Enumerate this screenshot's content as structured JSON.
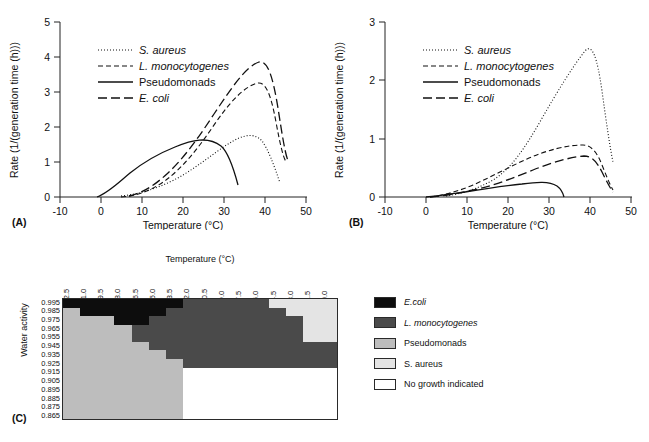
{
  "figure": {
    "panel_a_letter": "(A)",
    "panel_b_letter": "(B)",
    "panel_c_letter": "(C)"
  },
  "panelA": {
    "ylabel": "Rate (1/(generation time (h)))",
    "xlabel": "Temperature (°C)",
    "xticks": [
      "-10",
      "0",
      "10",
      "20",
      "30",
      "40",
      "50"
    ],
    "yticks": [
      "0",
      "1",
      "2",
      "3",
      "4",
      "5"
    ],
    "legend": [
      {
        "label": "S. aureus",
        "style": "dotted",
        "italic": true
      },
      {
        "label": "L. monocytogenes",
        "style": "dashed",
        "italic": true
      },
      {
        "label": "Pseudomonads",
        "style": "solid",
        "italic": false
      },
      {
        "label": "E. coli",
        "style": "longdash",
        "italic": true
      }
    ]
  },
  "panelB": {
    "ylabel": "Rate (1/(generation time (h)))",
    "xlabel": "Temperature (°C)",
    "xticks": [
      "-10",
      "0",
      "10",
      "20",
      "30",
      "40",
      "50"
    ],
    "yticks": [
      "0",
      "1",
      "2",
      "3"
    ],
    "legend": [
      {
        "label": "S. aureus",
        "style": "dotted",
        "italic": true
      },
      {
        "label": "L. monocytogenes",
        "style": "dashed",
        "italic": true
      },
      {
        "label": "Pseudomonads",
        "style": "solid",
        "italic": false
      },
      {
        "label": "E. coli",
        "style": "longdash",
        "italic": true
      }
    ]
  },
  "panelC": {
    "xlabel": "Temperature (°C)",
    "ylabel": "Water activity",
    "columns": [
      "22.5",
      "21.0",
      "19.5",
      "18.0",
      "16.5",
      "15.0",
      "13.5",
      "12.0",
      "10.5",
      "9.0",
      "7.5",
      "6.0",
      "4.5",
      "3.0",
      "1.5",
      "0.0"
    ],
    "rows": [
      "0.995",
      "0.985",
      "0.975",
      "0.965",
      "0.955",
      "0.945",
      "0.935",
      "0.925",
      "0.915",
      "0.905",
      "0.895",
      "0.885",
      "0.875",
      "0.865"
    ],
    "legend": [
      {
        "label": "E.coli",
        "color": "#0d0d0d",
        "italic": true
      },
      {
        "label": "L. monocytogenes",
        "color": "#4a4a4a",
        "italic": true
      },
      {
        "label": "Pseudomonads",
        "color": "#bdbdbd",
        "italic": false
      },
      {
        "label": "S. aureus",
        "color": "#e4e4e4",
        "italic": false
      },
      {
        "label": "No growth indicated",
        "color": "#ffffff",
        "italic": false
      }
    ],
    "colors": {
      "ecoli": "#0d0d0d",
      "listeria": "#4a4a4a",
      "pseudomonads": "#bdbdbd",
      "saureus": "#e4e4e4",
      "nogrowth": "#ffffff"
    }
  },
  "chart_data": [
    {
      "type": "line",
      "panel": "A",
      "title": "",
      "xlabel": "Temperature (°C)",
      "ylabel": "Rate (1/(generation time (h)))",
      "xlim": [
        -10,
        50
      ],
      "ylim": [
        0,
        5
      ],
      "xticks": [
        -10,
        0,
        10,
        20,
        30,
        40,
        50
      ],
      "yticks": [
        0,
        1,
        2,
        3,
        4,
        5
      ],
      "grid": false,
      "legend_position": "upper-left-inside",
      "series": [
        {
          "name": "S. aureus",
          "style": "dotted",
          "x": [
            5,
            10,
            15,
            20,
            25,
            30,
            35,
            40,
            42,
            44,
            45,
            46,
            46.5
          ],
          "y": [
            0.05,
            0.15,
            0.32,
            0.55,
            0.85,
            1.15,
            1.42,
            1.58,
            1.55,
            1.35,
            1.05,
            0.6,
            0.35
          ]
        },
        {
          "name": "L. monocytogenes",
          "style": "dashed",
          "x": [
            5,
            10,
            15,
            20,
            25,
            30,
            35,
            40,
            42,
            43,
            44,
            45,
            46,
            47
          ],
          "y": [
            0.02,
            0.12,
            0.38,
            0.8,
            1.45,
            2.2,
            2.9,
            3.22,
            3.25,
            3.1,
            2.7,
            2.0,
            1.3,
            1.0
          ]
        },
        {
          "name": "Pseudomonads",
          "style": "solid",
          "x": [
            -1,
            5,
            10,
            15,
            20,
            25,
            28,
            31,
            33,
            34.5,
            36
          ],
          "y": [
            0.0,
            0.3,
            0.62,
            0.92,
            1.12,
            1.32,
            1.42,
            1.45,
            1.35,
            1.0,
            0.4
          ]
        },
        {
          "name": "E. coli",
          "style": "longdash",
          "x": [
            7,
            10,
            15,
            20,
            25,
            30,
            35,
            40,
            42,
            43,
            44,
            45,
            46,
            47
          ],
          "y": [
            0.05,
            0.18,
            0.52,
            1.05,
            1.8,
            2.7,
            3.65,
            4.12,
            4.2,
            4.05,
            3.55,
            2.7,
            1.7,
            1.0
          ]
        }
      ]
    },
    {
      "type": "line",
      "panel": "B",
      "title": "",
      "xlabel": "Temperature (°C)",
      "ylabel": "Rate (1/(generation time (h)))",
      "xlim": [
        -10,
        50
      ],
      "ylim": [
        0,
        3
      ],
      "xticks": [
        -10,
        0,
        10,
        20,
        30,
        40,
        50
      ],
      "yticks": [
        0,
        1,
        2,
        3
      ],
      "grid": false,
      "legend_position": "upper-left-inside",
      "series": [
        {
          "name": "S. aureus",
          "style": "dotted",
          "x": [
            5,
            10,
            15,
            20,
            25,
            30,
            35,
            40,
            41,
            42,
            43,
            44,
            45,
            46,
            46.5
          ],
          "y": [
            0.02,
            0.08,
            0.22,
            0.5,
            1.0,
            1.6,
            2.15,
            2.48,
            2.5,
            2.42,
            2.2,
            1.8,
            1.15,
            0.7,
            0.6
          ]
        },
        {
          "name": "L. monocytogenes",
          "style": "dashed",
          "x": [
            2,
            5,
            10,
            15,
            20,
            25,
            30,
            35,
            40,
            41,
            42,
            43,
            44,
            45,
            46,
            47
          ],
          "y": [
            0.0,
            0.03,
            0.09,
            0.18,
            0.32,
            0.48,
            0.64,
            0.78,
            0.88,
            0.88,
            0.85,
            0.78,
            0.62,
            0.45,
            0.3,
            0.18
          ]
        },
        {
          "name": "Pseudomonads",
          "style": "solid",
          "x": [
            0,
            5,
            10,
            15,
            20,
            25,
            28,
            30,
            32,
            34,
            36
          ],
          "y": [
            0.0,
            0.02,
            0.05,
            0.09,
            0.13,
            0.18,
            0.21,
            0.22,
            0.2,
            0.14,
            0.02
          ]
        },
        {
          "name": "E. coli",
          "style": "longdash",
          "x": [
            2,
            5,
            10,
            15,
            20,
            25,
            30,
            35,
            40,
            41,
            42,
            43,
            44,
            45,
            46,
            47
          ],
          "y": [
            0.0,
            0.02,
            0.06,
            0.12,
            0.21,
            0.32,
            0.44,
            0.54,
            0.6,
            0.6,
            0.57,
            0.5,
            0.4,
            0.3,
            0.22,
            0.15
          ]
        }
      ]
    },
    {
      "type": "heatmap",
      "panel": "C",
      "title": "",
      "xlabel": "Temperature (°C)",
      "ylabel": "Water activity",
      "x_categories": [
        "22.5",
        "21.0",
        "19.5",
        "18.0",
        "16.5",
        "15.0",
        "13.5",
        "12.0",
        "10.5",
        "9.0",
        "7.5",
        "6.0",
        "4.5",
        "3.0",
        "1.5",
        "0.0"
      ],
      "y_categories": [
        "0.995",
        "0.985",
        "0.975",
        "0.965",
        "0.955",
        "0.945",
        "0.935",
        "0.925",
        "0.915",
        "0.905",
        "0.895",
        "0.885",
        "0.875",
        "0.865"
      ],
      "category_legend": [
        "E.coli",
        "L. monocytogenes",
        "Pseudomonads",
        "S. aureus",
        "No growth indicated"
      ],
      "cells": [
        [
          "E",
          "E",
          "E",
          "E",
          "E",
          "E",
          "E",
          "L",
          "L",
          "L",
          "L",
          "L",
          "S",
          "S",
          "S",
          "S"
        ],
        [
          "P",
          "E",
          "E",
          "E",
          "E",
          "E",
          "L",
          "L",
          "L",
          "L",
          "L",
          "L",
          "L",
          "S",
          "S",
          "S"
        ],
        [
          "P",
          "P",
          "P",
          "E",
          "E",
          "L",
          "L",
          "L",
          "L",
          "L",
          "L",
          "L",
          "L",
          "L",
          "S",
          "S"
        ],
        [
          "P",
          "P",
          "P",
          "P",
          "L",
          "L",
          "L",
          "L",
          "L",
          "L",
          "L",
          "L",
          "L",
          "L",
          "S",
          "S"
        ],
        [
          "P",
          "P",
          "P",
          "P",
          "L",
          "L",
          "L",
          "L",
          "L",
          "L",
          "L",
          "L",
          "L",
          "L",
          "S",
          "S"
        ],
        [
          "P",
          "P",
          "P",
          "P",
          "P",
          "L",
          "L",
          "L",
          "L",
          "L",
          "L",
          "L",
          "L",
          "L",
          "L",
          "L"
        ],
        [
          "P",
          "P",
          "P",
          "P",
          "P",
          "P",
          "L",
          "L",
          "L",
          "L",
          "L",
          "L",
          "L",
          "L",
          "L",
          "L"
        ],
        [
          "P",
          "P",
          "P",
          "P",
          "P",
          "P",
          "P",
          "L",
          "L",
          "L",
          "L",
          "L",
          "L",
          "L",
          "L",
          "L"
        ],
        [
          "P",
          "P",
          "P",
          "P",
          "P",
          "P",
          "P",
          "N",
          "N",
          "N",
          "N",
          "N",
          "N",
          "N",
          "N",
          "N"
        ],
        [
          "P",
          "P",
          "P",
          "P",
          "P",
          "P",
          "P",
          "N",
          "N",
          "N",
          "N",
          "N",
          "N",
          "N",
          "N",
          "N"
        ],
        [
          "P",
          "P",
          "P",
          "P",
          "P",
          "P",
          "P",
          "N",
          "N",
          "N",
          "N",
          "N",
          "N",
          "N",
          "N",
          "N"
        ],
        [
          "P",
          "P",
          "P",
          "P",
          "P",
          "P",
          "P",
          "N",
          "N",
          "N",
          "N",
          "N",
          "N",
          "N",
          "N",
          "N"
        ],
        [
          "P",
          "P",
          "P",
          "P",
          "P",
          "P",
          "P",
          "N",
          "N",
          "N",
          "N",
          "N",
          "N",
          "N",
          "N",
          "N"
        ],
        [
          "P",
          "P",
          "P",
          "P",
          "P",
          "P",
          "P",
          "N",
          "N",
          "N",
          "N",
          "N",
          "N",
          "N",
          "N",
          "N"
        ]
      ],
      "legend_position": "right"
    }
  ]
}
